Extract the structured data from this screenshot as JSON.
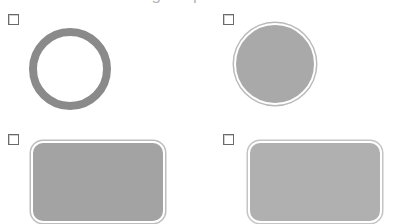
{
  "heading": {
    "text": "Select matching shapes"
  },
  "options": [
    {
      "id": "outline-circle",
      "shape": "circle-outline",
      "checked": false,
      "color": "#8a8a8a"
    },
    {
      "id": "filled-circle",
      "shape": "circle-filled",
      "checked": false,
      "color": "#a9a9a9"
    },
    {
      "id": "rounded-rect-dark",
      "shape": "rounded-rectangle-filled",
      "checked": false,
      "color": "#a3a3a3"
    },
    {
      "id": "rounded-rect-light",
      "shape": "rounded-rectangle-filled",
      "checked": false,
      "color": "#b0b0b0"
    }
  ]
}
